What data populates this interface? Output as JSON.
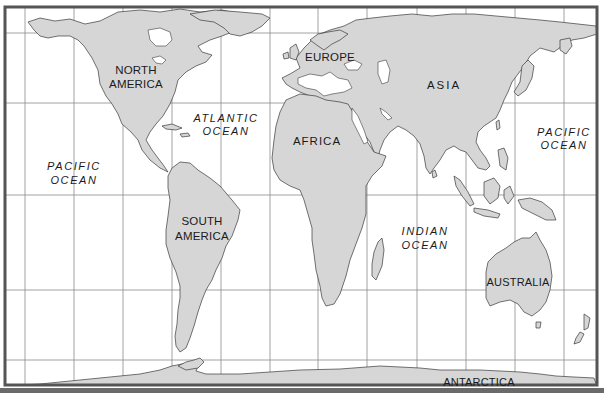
{
  "map": {
    "title": "World Map",
    "colors": {
      "land": "#d6d6d6",
      "ocean": "#ffffff",
      "coastline": "#3a3a3a",
      "grid": "#8a8a8a",
      "frame": "#555555"
    },
    "continents": [
      {
        "id": "north-america",
        "lines": [
          "NORTH",
          "AMERICA"
        ]
      },
      {
        "id": "south-america",
        "lines": [
          "SOUTH",
          "AMERICA"
        ]
      },
      {
        "id": "europe",
        "lines": [
          "EUROPE"
        ]
      },
      {
        "id": "africa",
        "lines": [
          "AFRICA"
        ]
      },
      {
        "id": "asia",
        "lines": [
          "ASIA"
        ]
      },
      {
        "id": "australia",
        "lines": [
          "AUSTRALIA"
        ]
      },
      {
        "id": "antarctica",
        "lines": [
          "ANTARCTICA"
        ]
      }
    ],
    "oceans": [
      {
        "id": "pacific-west",
        "lines": [
          "PACIFIC",
          "OCEAN"
        ]
      },
      {
        "id": "atlantic",
        "lines": [
          "ATLANTIC",
          "OCEAN"
        ]
      },
      {
        "id": "indian",
        "lines": [
          "INDIAN",
          "OCEAN"
        ]
      },
      {
        "id": "pacific-east",
        "lines": [
          "PACIFIC",
          "OCEAN"
        ]
      }
    ],
    "grid": {
      "meridians_x": [
        25,
        74,
        123,
        172,
        221,
        270,
        318,
        367,
        417,
        466,
        515,
        564
      ],
      "parallels_y": [
        33,
        103,
        195,
        290,
        360
      ]
    }
  }
}
